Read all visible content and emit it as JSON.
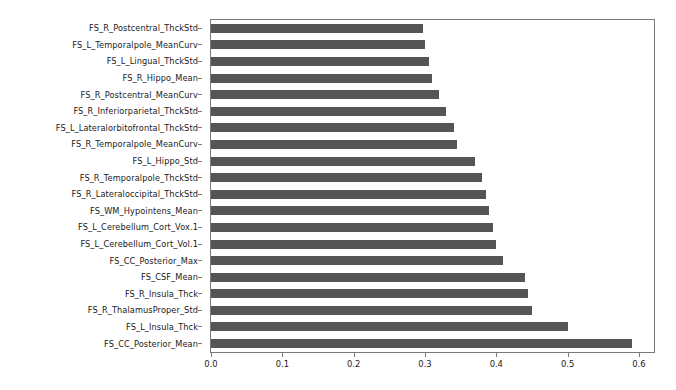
{
  "chart_data": {
    "type": "bar",
    "orientation": "horizontal",
    "title": "",
    "xlabel": "",
    "ylabel": "",
    "xlim": [
      0.0,
      0.6225
    ],
    "xticks": [
      0.0,
      0.1,
      0.2,
      0.3,
      0.4,
      0.5,
      0.6
    ],
    "xtick_labels": [
      "0.0",
      "0.1",
      "0.2",
      "0.3",
      "0.4",
      "0.5",
      "0.6"
    ],
    "grid": false,
    "legend": "none",
    "bar_color": "#555555",
    "axis_color": "#7a7a7a",
    "categories": [
      "FS_R_Postcentral_ThckStd",
      "FS_L_Temporalpole_MeanCurv",
      "FS_L_Lingual_ThckStd",
      "FS_R_Hippo_Mean",
      "FS_R_Postcentral_MeanCurv",
      "FS_R_Inferiorparietal_ThckStd",
      "FS_L_Lateralorbitofrontal_ThckStd",
      "FS_R_Temporalpole_MeanCurv",
      "FS_L_Hippo_Std",
      "FS_R_Temporalpole_ThckStd",
      "FS_R_Lateraloccipital_ThckStd",
      "FS_WM_Hypointens_Mean",
      "FS_L_Cerebellum_Cort_Vox.1",
      "FS_L_Cerebellum_Cort_Vol.1",
      "FS_CC_Posterior_Max",
      "FS_CSF_Mean",
      "FS_R_Insula_Thck",
      "FS_R_ThalamusProper_Std",
      "FS_L_Insula_Thck",
      "FS_CC_Posterior_Mean"
    ],
    "values": [
      0.297,
      0.3,
      0.305,
      0.31,
      0.32,
      0.33,
      0.34,
      0.345,
      0.37,
      0.38,
      0.385,
      0.39,
      0.395,
      0.4,
      0.41,
      0.44,
      0.445,
      0.45,
      0.5,
      0.59
    ]
  }
}
